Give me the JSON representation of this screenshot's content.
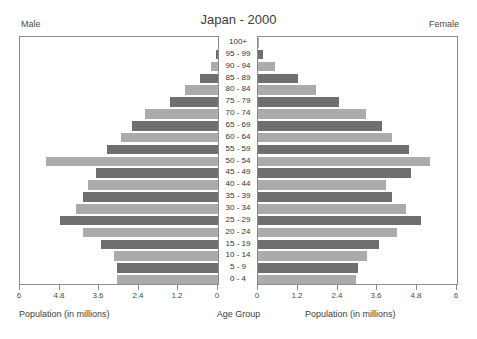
{
  "header": {
    "left_label": "Male",
    "right_label": "Female",
    "title": "Japan - 2000"
  },
  "captions": {
    "left": "Population (in millions)",
    "center": "Age Group",
    "right": "Population (in millions)"
  },
  "axis_ticks_left": [
    "6",
    "4.8",
    "3.6",
    "2.4",
    "1.2",
    "0"
  ],
  "axis_ticks_right": [
    "0",
    "1.2",
    "2.4",
    "3.6",
    "4.8",
    "6"
  ],
  "chart_data": {
    "type": "bar",
    "subtype": "population-pyramid",
    "title": "Japan - 2000",
    "xlabel": "Population (in millions)",
    "ylabel": "Age Group",
    "xlim": [
      0,
      6
    ],
    "xticks": [
      0,
      1.2,
      2.4,
      3.6,
      4.8,
      6
    ],
    "grid": false,
    "legend": "none",
    "bar_colors": {
      "dark": "#6f6f6f",
      "light": "#ababab"
    },
    "categories": [
      "100+",
      "95 - 99",
      "90 - 94",
      "85 - 89",
      "80 - 84",
      "75 - 79",
      "70 - 74",
      "65 - 69",
      "60 - 64",
      "55 - 59",
      "50 - 54",
      "45 - 49",
      "40 - 44",
      "35 - 39",
      "30 - 34",
      "25 - 29",
      "20 - 24",
      "15 - 19",
      "10 - 14",
      "5 - 9",
      "0 - 4"
    ],
    "series": [
      {
        "name": "Male",
        "direction": "left",
        "values": [
          0.01,
          0.05,
          0.2,
          0.55,
          1.0,
          1.45,
          2.2,
          2.6,
          2.95,
          3.35,
          5.2,
          3.7,
          3.95,
          4.1,
          4.3,
          4.8,
          4.1,
          3.55,
          3.15,
          3.05,
          3.05
        ]
      },
      {
        "name": "Female",
        "direction": "right",
        "values": [
          0.02,
          0.15,
          0.5,
          1.2,
          1.75,
          2.45,
          3.25,
          3.75,
          4.05,
          4.55,
          5.2,
          4.6,
          3.85,
          4.05,
          4.45,
          4.9,
          4.2,
          3.65,
          3.3,
          3.0,
          2.95
        ]
      }
    ]
  }
}
